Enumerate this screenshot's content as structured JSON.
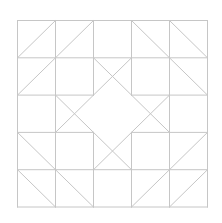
{
  "diagram": {
    "type": "quilt-block",
    "grid": {
      "cols": 5,
      "rows": 5
    },
    "origin": [
      17,
      20
    ],
    "cell_w": 38,
    "cell_h": 37.3,
    "colors": {
      "background": "#ffffff",
      "line": "#c6c6c6"
    },
    "line_width": 1,
    "outer_square": true,
    "grid_segments": [
      [
        0,
        1,
        5,
        1
      ],
      [
        0,
        4,
        5,
        4
      ],
      [
        1,
        0,
        1,
        5
      ],
      [
        4,
        0,
        4,
        5
      ],
      [
        0,
        2,
        2,
        2
      ],
      [
        3,
        2,
        5,
        2
      ],
      [
        0,
        3,
        2,
        3
      ],
      [
        3,
        3,
        5,
        3
      ],
      [
        2,
        0,
        2,
        2
      ],
      [
        2,
        3,
        2,
        5
      ],
      [
        3,
        0,
        3,
        2
      ],
      [
        3,
        3,
        3,
        5
      ]
    ],
    "diagonals": [
      [
        0,
        1,
        1,
        0
      ],
      [
        1,
        1,
        2,
        0
      ],
      [
        3,
        0,
        4,
        1
      ],
      [
        4,
        0,
        5,
        1
      ],
      [
        0,
        2,
        1,
        1
      ],
      [
        4,
        1,
        5,
        2
      ],
      [
        0,
        3,
        1,
        4
      ],
      [
        0,
        4,
        1,
        5
      ],
      [
        1,
        4,
        2,
        5
      ],
      [
        4,
        4,
        5,
        3
      ],
      [
        3,
        5,
        4,
        4
      ],
      [
        4,
        5,
        5,
        4
      ],
      [
        2,
        1,
        3,
        2
      ],
      [
        3,
        1,
        2,
        2
      ],
      [
        1,
        2,
        2,
        3
      ],
      [
        2,
        2,
        1,
        3
      ],
      [
        3,
        2,
        4,
        3
      ],
      [
        4,
        2,
        3,
        3
      ],
      [
        2,
        3,
        3,
        4
      ],
      [
        3,
        3,
        2,
        4
      ]
    ]
  }
}
